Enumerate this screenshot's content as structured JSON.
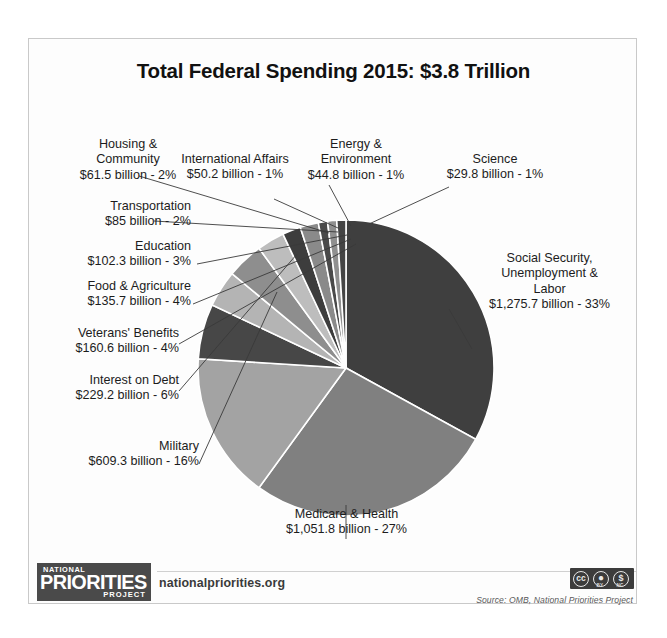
{
  "chart_data": {
    "type": "pie",
    "title": "Total Federal Spending 2015: $3.8 Trillion",
    "total_label": "$3.8 Trillion",
    "year": "2015",
    "units": "billion",
    "legend_position": "callout-labels",
    "grid": false,
    "categories": [
      "Social Security, Unemployment & Labor",
      "Medicare & Health",
      "Military",
      "Interest on Debt",
      "Veterans' Benefits",
      "Food & Agriculture",
      "Education",
      "Transportation",
      "Housing & Community",
      "International Affairs",
      "Energy & Environment",
      "Science"
    ],
    "values": [
      1275.7,
      1051.8,
      609.3,
      229.2,
      160.6,
      135.7,
      102.3,
      85,
      61.5,
      50.2,
      44.8,
      29.8
    ],
    "percents": [
      33,
      27,
      16,
      6,
      4,
      4,
      3,
      2,
      2,
      1,
      1,
      1
    ],
    "colors": [
      "#3f3f3f",
      "#808080",
      "#a3a3a3",
      "#474747",
      "#b4b4b4",
      "#8e8e8e",
      "#bdbdbd",
      "#3d3d3d",
      "#8a8a8a",
      "#4a4a4a",
      "#909090",
      "#454545"
    ],
    "slices": [
      {
        "name": "Social Security, Unemployment & Labor",
        "label_lines": [
          "Social Security,",
          "Unemployment &",
          "Labor",
          "$1,275.7 billion - 33%"
        ],
        "value": 1275.7,
        "percent": 33,
        "color": "#3f3f3f"
      },
      {
        "name": "Medicare & Health",
        "label_lines": [
          "Medicare & Health",
          "$1,051.8 billion - 27%"
        ],
        "value": 1051.8,
        "percent": 27,
        "color": "#808080"
      },
      {
        "name": "Military",
        "label_lines": [
          "Military",
          "$609.3 billion - 16%"
        ],
        "value": 609.3,
        "percent": 16,
        "color": "#a3a3a3"
      },
      {
        "name": "Interest on Debt",
        "label_lines": [
          "Interest on Debt",
          "$229.2 billion - 6%"
        ],
        "value": 229.2,
        "percent": 6,
        "color": "#474747"
      },
      {
        "name": "Veterans' Benefits",
        "label_lines": [
          "Veterans' Benefits",
          "$160.6 billion - 4%"
        ],
        "value": 160.6,
        "percent": 4,
        "color": "#b4b4b4"
      },
      {
        "name": "Food & Agriculture",
        "label_lines": [
          "Food & Agriculture",
          "$135.7 billion - 4%"
        ],
        "value": 135.7,
        "percent": 4,
        "color": "#8e8e8e"
      },
      {
        "name": "Education",
        "label_lines": [
          "Education",
          "$102.3 billion - 3%"
        ],
        "value": 102.3,
        "percent": 3,
        "color": "#bdbdbd"
      },
      {
        "name": "Transportation",
        "label_lines": [
          "Transportation",
          "$85 billion - 2%"
        ],
        "value": 85,
        "percent": 2,
        "color": "#3d3d3d"
      },
      {
        "name": "Housing & Community",
        "label_lines": [
          "Housing &",
          "Community",
          "$61.5 billion - 2%"
        ],
        "value": 61.5,
        "percent": 2,
        "color": "#8a8a8a"
      },
      {
        "name": "International Affairs",
        "label_lines": [
          "International Affairs",
          "$50.2 billion - 1%"
        ],
        "value": 50.2,
        "percent": 1,
        "color": "#4a4a4a"
      },
      {
        "name": "Energy & Environment",
        "label_lines": [
          "Energy &",
          "Environment",
          "$44.8 billion - 1%"
        ],
        "value": 44.8,
        "percent": 1,
        "color": "#909090"
      },
      {
        "name": "Science",
        "label_lines": [
          "Science",
          "$29.8 billion - 1%"
        ],
        "value": 29.8,
        "percent": 1,
        "color": "#454545"
      }
    ]
  },
  "labels": {
    "housing_l1": "Housing &",
    "housing_l2": "Community",
    "housing_l3": "$61.5 billion - 2%",
    "intl_l1": "International Affairs",
    "intl_l2": "$50.2 billion - 1%",
    "energy_l1": "Energy &",
    "energy_l2": "Environment",
    "energy_l3": "$44.8 billion - 1%",
    "science_l1": "Science",
    "science_l2": "$29.8 billion - 1%",
    "transport_l1": "Transportation",
    "transport_l2": "$85 billion - 2%",
    "education_l1": "Education",
    "education_l2": "$102.3 billion - 3%",
    "food_l1": "Food & Agriculture",
    "food_l2": "$135.7 billion - 4%",
    "veterans_l1": "Veterans' Benefits",
    "veterans_l2": "$160.6 billion - 4%",
    "interest_l1": "Interest on Debt",
    "interest_l2": "$229.2 billion - 6%",
    "military_l1": "Military",
    "military_l2": "$609.3 billion - 16%",
    "ssa_l1": "Social Security,",
    "ssa_l2": "Unemployment &",
    "ssa_l3": "Labor",
    "ssa_l4": "$1,275.7 billion - 33%",
    "medicare_l1": "Medicare & Health",
    "medicare_l2": "$1,051.8 billion - 27%"
  },
  "footer": {
    "logo_line1": "NATIONAL",
    "logo_line2": "PRIORITIES",
    "logo_line3": "PROJECT",
    "url": "nationalpriorities.org",
    "source": "Source: OMB, National Priorities Project",
    "cc_main": "cc",
    "cc_by_glyph": "ƒ",
    "cc_nc_glyph": "ⓢ",
    "cc_by_label": "BY",
    "cc_nc_label": "NC"
  }
}
